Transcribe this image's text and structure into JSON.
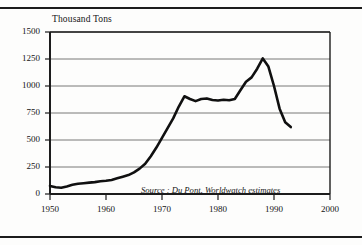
{
  "figure": {
    "axis_title": "Thousand Tons",
    "source_note": "Source : Du Pont, Worldwatch estimates",
    "frame_color": "#1c1c1c",
    "grid_color": "#555555",
    "line_color": "#101010",
    "background": "#fdfdfc"
  },
  "chart_data": {
    "type": "line",
    "title": "",
    "subtitle": "",
    "xlabel": "",
    "ylabel": "Thousand Tons",
    "xlim": [
      1950,
      2000
    ],
    "ylim": [
      0,
      1500
    ],
    "grid": true,
    "grid_axis": "y",
    "legend": "none",
    "annotations": [
      "Source : Du Pont, Worldwatch estimates"
    ],
    "yticks": [
      0,
      250,
      500,
      750,
      1000,
      1250,
      1500
    ],
    "ytick_labels": [
      "0",
      "250",
      "500",
      "750",
      "1000",
      "1250",
      "1500"
    ],
    "xticks": [
      1950,
      1960,
      1970,
      1980,
      1990,
      2000
    ],
    "xtick_labels": [
      "1950",
      "1960",
      "1970",
      "1980",
      "1990",
      "2000"
    ],
    "series": [
      {
        "name": "CFC production",
        "x": [
          1950,
          1951,
          1952,
          1953,
          1954,
          1955,
          1956,
          1957,
          1958,
          1959,
          1960,
          1961,
          1962,
          1963,
          1964,
          1965,
          1966,
          1967,
          1968,
          1969,
          1970,
          1971,
          1972,
          1973,
          1974,
          1975,
          1976,
          1977,
          1978,
          1979,
          1980,
          1981,
          1982,
          1983,
          1984,
          1985,
          1986,
          1987,
          1988,
          1989,
          1990,
          1991,
          1992,
          1993
        ],
        "values": [
          75,
          62,
          58,
          70,
          85,
          95,
          100,
          105,
          110,
          118,
          122,
          130,
          145,
          160,
          175,
          200,
          235,
          280,
          350,
          430,
          520,
          610,
          700,
          810,
          905,
          880,
          860,
          880,
          885,
          870,
          865,
          872,
          868,
          880,
          960,
          1040,
          1080,
          1160,
          1255,
          1180,
          1000,
          790,
          665,
          620
        ],
        "units": "thousand tons"
      }
    ]
  },
  "ylabels": [
    "1500",
    "1250",
    "1000",
    "750",
    "500",
    "250",
    "0"
  ],
  "xlabels": [
    "1950",
    "1960",
    "1970",
    "1980",
    "1990",
    "2000"
  ]
}
